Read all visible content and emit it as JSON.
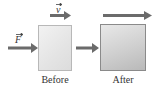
{
  "diagram": {
    "boxes": [
      {
        "id": "before",
        "label": "Before"
      },
      {
        "id": "after",
        "label": "After"
      }
    ],
    "vectors": [
      {
        "id": "force",
        "symbol": "F",
        "description": "applied force arrow pointing right into Before box"
      },
      {
        "id": "velocity-before",
        "symbol": "v",
        "description": "short velocity arrow above Before box"
      },
      {
        "id": "transition",
        "symbol": "",
        "description": "arrow from Before box to After box"
      },
      {
        "id": "velocity-after",
        "symbol": "",
        "description": "long velocity arrow above After box"
      }
    ],
    "colors": {
      "arrow": "#6b6b6b",
      "before_fill": "#e6e6e6",
      "after_fill": "#c8c8c8"
    }
  }
}
